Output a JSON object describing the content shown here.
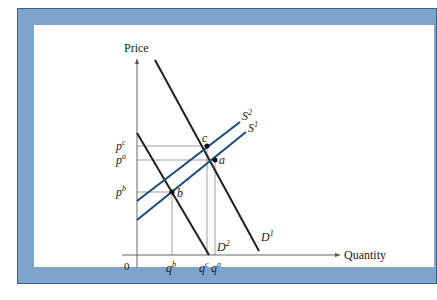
{
  "diagram": {
    "axes": {
      "y_label": "Price",
      "x_label": "Quantity",
      "origin": "0"
    },
    "curves": [
      {
        "id": "D1",
        "name": "D",
        "sup": "1",
        "type": "demand",
        "color": "#1f1f1f"
      },
      {
        "id": "D2",
        "name": "D",
        "sup": "2",
        "type": "demand",
        "color": "#1f1f1f"
      },
      {
        "id": "S1",
        "name": "S",
        "sup": "1",
        "type": "supply",
        "color": "#1f4e79"
      },
      {
        "id": "S2",
        "name": "S",
        "sup": "2",
        "type": "supply",
        "color": "#1f4e79"
      }
    ],
    "points": [
      {
        "id": "a",
        "label": "a"
      },
      {
        "id": "b",
        "label": "b"
      },
      {
        "id": "c",
        "label": "c"
      }
    ],
    "price_ticks": [
      {
        "base": "p",
        "sup": "c"
      },
      {
        "base": "p",
        "sup": "a"
      },
      {
        "base": "p",
        "sup": "b"
      }
    ],
    "quantity_ticks": [
      {
        "base": "q",
        "sup": "b"
      },
      {
        "base": "q",
        "sup": "c"
      },
      {
        "base": "q",
        "sup": "a"
      }
    ],
    "colors": {
      "frame": "#7ea3cc",
      "frame_border": "#3f5f86",
      "supply": "#1f4e79",
      "demand": "#1f1f1f",
      "guide": "#888888"
    }
  }
}
